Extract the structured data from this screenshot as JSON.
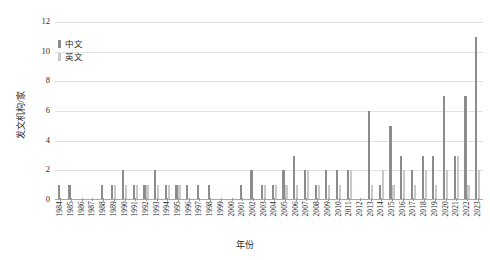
{
  "chart_data": {
    "type": "bar",
    "title": "",
    "xlabel": "年份",
    "ylabel": "发文机构/家",
    "ylim": [
      0,
      12
    ],
    "yticks": [
      0,
      2,
      4,
      6,
      8,
      10,
      12
    ],
    "grid": true,
    "legend_position": "top-left",
    "categories": [
      "1984",
      "1985",
      "1986",
      "1987",
      "1988",
      "1989",
      "1990",
      "1991",
      "1992",
      "1993",
      "1994",
      "1995",
      "1996",
      "1997",
      "1998",
      "1999",
      "2000",
      "2001",
      "2002",
      "2003",
      "2004",
      "2005",
      "2006",
      "2007",
      "2008",
      "2009",
      "2010",
      "2011",
      "2012",
      "2013",
      "2014",
      "2015",
      "2016",
      "2017",
      "2018",
      "2019",
      "2020",
      "2021",
      "2022",
      "2023"
    ],
    "series": [
      {
        "name": "中文",
        "color": "#8c8c8c",
        "values": [
          1,
          1,
          0,
          0,
          1,
          1,
          2,
          1,
          1,
          2,
          1,
          1,
          1,
          1,
          1,
          0,
          0,
          1,
          2,
          1,
          1,
          2,
          3,
          2,
          1,
          2,
          2,
          2,
          0,
          6,
          1,
          5,
          3,
          2,
          3,
          3,
          7,
          3,
          7,
          11
        ]
      },
      {
        "name": "英文",
        "color": "#c9c9c9",
        "values": [
          0,
          0,
          0,
          0,
          0,
          1,
          1,
          1,
          1,
          1,
          1,
          1,
          0,
          0,
          0,
          0,
          0,
          0,
          0,
          1,
          1,
          1,
          1,
          2,
          1,
          1,
          1,
          2,
          0,
          1,
          2,
          1,
          2,
          1,
          2,
          1,
          2,
          3,
          1,
          2
        ]
      }
    ]
  },
  "legend": {
    "items": [
      {
        "label": "中文",
        "color": "#8c8c8c"
      },
      {
        "label": "英文",
        "color": "#c9c9c9"
      }
    ]
  },
  "axes": {
    "y_title": "发文机构/家",
    "x_title": "年份"
  }
}
